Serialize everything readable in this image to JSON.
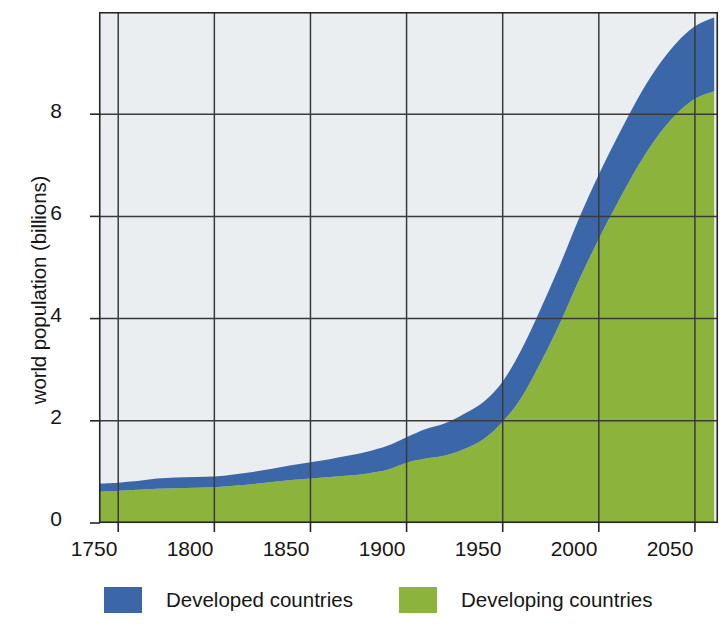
{
  "chart_data": {
    "type": "area",
    "stacked": true,
    "title": "",
    "subtitle": "",
    "xlabel": "",
    "ylabel": "world population (billions)",
    "xlim": [
      1740,
      2062
    ],
    "ylim": [
      0,
      10
    ],
    "xticks": [
      1750,
      1800,
      1850,
      1900,
      1950,
      2000,
      2050
    ],
    "xtick_labels": [
      "1750",
      "1800",
      "1850",
      "1900",
      "1950",
      "2000",
      "2050"
    ],
    "yticks": [
      0,
      2,
      4,
      6,
      8
    ],
    "ytick_labels": [
      "0",
      "2",
      "4",
      "6",
      "8"
    ],
    "grid": true,
    "legend_position": "bottom",
    "x": [
      1740,
      1750,
      1760,
      1770,
      1780,
      1790,
      1800,
      1810,
      1820,
      1830,
      1840,
      1850,
      1860,
      1870,
      1880,
      1890,
      1900,
      1910,
      1920,
      1930,
      1940,
      1950,
      1960,
      1970,
      1980,
      1990,
      2000,
      2010,
      2020,
      2030,
      2040,
      2050,
      2060
    ],
    "series": [
      {
        "name": "Developing countries",
        "color": "#8cb43c",
        "values": [
          0.61,
          0.63,
          0.65,
          0.67,
          0.68,
          0.69,
          0.7,
          0.73,
          0.76,
          0.8,
          0.84,
          0.87,
          0.9,
          0.93,
          0.97,
          1.04,
          1.18,
          1.26,
          1.32,
          1.45,
          1.64,
          1.98,
          2.47,
          3.16,
          3.93,
          4.78,
          5.56,
          6.28,
          6.96,
          7.54,
          7.99,
          8.3,
          8.45
        ]
      },
      {
        "name": "Developed countries",
        "color": "#3b67a8",
        "values": [
          0.16,
          0.16,
          0.17,
          0.2,
          0.21,
          0.21,
          0.21,
          0.22,
          0.24,
          0.26,
          0.29,
          0.32,
          0.35,
          0.39,
          0.43,
          0.47,
          0.5,
          0.58,
          0.63,
          0.69,
          0.73,
          0.79,
          0.94,
          1.05,
          1.14,
          1.21,
          1.26,
          1.3,
          1.33,
          1.36,
          1.39,
          1.42,
          1.44
        ]
      }
    ],
    "totals": [
      0.77,
      0.79,
      0.82,
      0.87,
      0.89,
      0.9,
      0.91,
      0.95,
      1.0,
      1.06,
      1.13,
      1.19,
      1.25,
      1.32,
      1.4,
      1.51,
      1.68,
      1.84,
      1.95,
      2.14,
      2.37,
      2.77,
      3.41,
      4.21,
      5.07,
      5.99,
      6.82,
      7.58,
      8.29,
      8.9,
      9.38,
      9.72,
      9.89
    ],
    "annotations": []
  },
  "legend": {
    "items": [
      {
        "label": "Developed countries",
        "color": "#3b67a8",
        "icon": "square-swatch-icon"
      },
      {
        "label": "Developing countries",
        "color": "#8cb43c",
        "icon": "square-swatch-icon"
      }
    ]
  },
  "style": {
    "plot_background": "#eaeef0",
    "axis_color": "#262626",
    "grid_color": "#3a3a3a",
    "text_color": "#161616"
  }
}
